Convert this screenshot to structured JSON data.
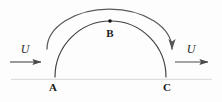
{
  "figure": {
    "background_color": "#fdfdfd",
    "line_color": "#3a3a3a",
    "ground_color": "#2b2b2b",
    "label_color": "#1a1a1a",
    "width": 222,
    "height": 102
  },
  "labels": {
    "point_a": "A",
    "point_b": "B",
    "point_c": "C",
    "velocity_left": "U",
    "velocity_right": "U"
  },
  "geometry": {
    "ground": {
      "x1": 11,
      "y1": 77,
      "x2": 212,
      "y2": 77
    },
    "bump_arc": {
      "start_x": 55,
      "end_x": 166,
      "baseline_y": 77,
      "apex_y": 21
    },
    "flow_arc": {
      "start_x": 47,
      "start_y": 49,
      "end_x": 172,
      "end_y": 49,
      "apex_y": 9
    },
    "point_b_marker": {
      "x": 110,
      "y": 21,
      "r": 1.8
    },
    "arrow_left": {
      "x1": 10,
      "x2": 43,
      "y": 62
    },
    "arrow_right": {
      "x1": 175,
      "x2": 210,
      "y": 62
    }
  },
  "label_positions": {
    "point_a": {
      "x": 53,
      "y": 81
    },
    "point_b": {
      "x": 110,
      "y": 27
    },
    "point_c": {
      "x": 167,
      "y": 81
    },
    "velocity_left": {
      "x": 25,
      "y": 42
    },
    "velocity_right": {
      "x": 191,
      "y": 42
    }
  }
}
